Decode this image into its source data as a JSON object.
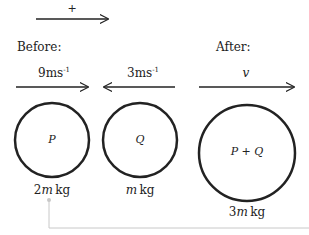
{
  "diagram": {
    "positive_direction": {
      "label": "+"
    },
    "before": {
      "heading": "Before:",
      "particles": [
        {
          "name": "P",
          "velocity": "9",
          "velocity_unit": "ms",
          "velocity_exp": "-1",
          "direction": "right",
          "mass_coef": "2",
          "mass_var": "m",
          "mass_unit": "kg"
        },
        {
          "name": "Q",
          "velocity": "3",
          "velocity_unit": "ms",
          "velocity_exp": "-1",
          "direction": "left",
          "mass_coef": "",
          "mass_var": "m",
          "mass_unit": "kg"
        }
      ]
    },
    "after": {
      "heading": "After:",
      "particle": {
        "name": "P + Q",
        "velocity": "v",
        "direction": "right",
        "mass_coef": "3",
        "mass_var": "m",
        "mass_unit": "kg"
      }
    },
    "colors": {
      "stroke": "#222222",
      "connector": "#c8c8c8"
    }
  }
}
